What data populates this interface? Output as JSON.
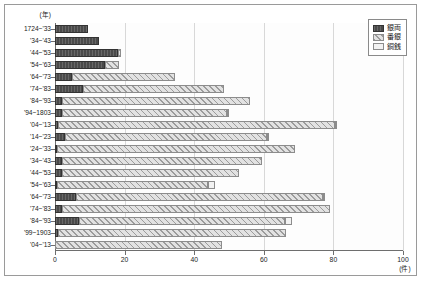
{
  "chart_data": {
    "type": "bar",
    "orientation": "horizontal",
    "stacked": true,
    "title": "",
    "xlabel": "(件)",
    "ylabel": "(年)",
    "xlim": [
      0,
      100
    ],
    "xticks": [
      0,
      20,
      40,
      60,
      80,
      100
    ],
    "grid": true,
    "legend_position": "top-right",
    "categories": [
      "1724~'33",
      "'34~'43",
      "'44~'53",
      "'54~'63",
      "'64~'73",
      "'74~'83",
      "'84~'93",
      "'94~1803",
      "'04~'13",
      "'14~'23",
      "'24~'33",
      "'34~'43",
      "'44~'53",
      "'54~'63",
      "'64~'73",
      "'74~'83",
      "'84~'93",
      "'99~1903",
      "'04~'13"
    ],
    "series": [
      {
        "name": "銀両",
        "color": "#4a4a4a",
        "pattern": "solid-dark",
        "values": [
          9.5,
          12.5,
          18.0,
          14.5,
          5.0,
          8.0,
          2.0,
          2.0,
          1.0,
          3.0,
          0.5,
          2.0,
          2.0,
          0.5,
          6.0,
          2.0,
          7.0,
          1.0,
          0.0
        ]
      },
      {
        "name": "番銀",
        "color": "#e2e2e2",
        "pattern": "diagonal-hatch",
        "values": [
          0.0,
          0.0,
          1.0,
          4.0,
          29.5,
          40.5,
          54.0,
          47.5,
          79.5,
          58.0,
          68.5,
          57.5,
          51.0,
          43.5,
          71.0,
          77.0,
          59.0,
          65.5,
          48.0
        ]
      },
      {
        "name": "銅銭",
        "color": "#f2f2f2",
        "pattern": "plain-light",
        "values": [
          0.0,
          0.0,
          0.0,
          0.0,
          0.0,
          0.0,
          0.0,
          0.5,
          0.5,
          0.5,
          0.0,
          0.0,
          0.0,
          2.0,
          0.5,
          0.0,
          2.0,
          0.0,
          0.0
        ]
      }
    ]
  },
  "legend": {
    "items": [
      {
        "label": "銀両"
      },
      {
        "label": "番銀"
      },
      {
        "label": "銅銭"
      }
    ]
  }
}
